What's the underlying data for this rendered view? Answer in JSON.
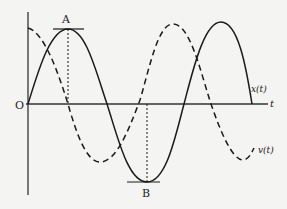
{
  "diagram": {
    "colors": {
      "background": "#f4f4f2",
      "ink": "#1a1a1a"
    },
    "axes": {
      "origin_label": "O",
      "horizontal_label": "t"
    },
    "curves": [
      {
        "id": "x",
        "label": "x(t)",
        "style": "solid",
        "description": "displacement, starts at origin, sine-shaped"
      },
      {
        "id": "v",
        "label": "v(t)",
        "style": "dashed",
        "description": "velocity, starts at maximum, cosine-shaped"
      }
    ],
    "points": [
      {
        "id": "A",
        "label": "A",
        "description": "maximum of x(t); v(t) crosses zero below it"
      },
      {
        "id": "B",
        "label": "B",
        "description": "minimum of x(t); v(t) crosses zero above it"
      }
    ]
  }
}
